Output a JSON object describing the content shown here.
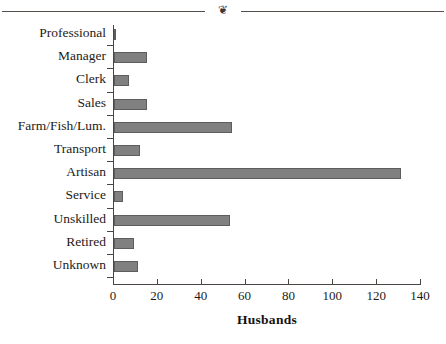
{
  "decoration": {
    "ornament_glyph": "❦",
    "ornament_name": "floral-ornament"
  },
  "chart_data": {
    "type": "bar",
    "orientation": "horizontal",
    "title": "",
    "xlabel": "Husbands",
    "ylabel": "",
    "xlim": [
      0,
      140
    ],
    "xticks": [
      0,
      20,
      40,
      60,
      80,
      100,
      120,
      140
    ],
    "grid": false,
    "legend": null,
    "categories": [
      "Professional",
      "Manager",
      "Clerk",
      "Sales",
      "Farm/Fish/Lum.",
      "Transport",
      "Artisan",
      "Service",
      "Unskilled",
      "Retired",
      "Unknown"
    ],
    "values": [
      1,
      15,
      7,
      15,
      54,
      12,
      131,
      4,
      53,
      9,
      11
    ],
    "series": [
      {
        "name": "Husbands",
        "values": [
          1,
          15,
          7,
          15,
          54,
          12,
          131,
          4,
          53,
          9,
          11
        ]
      }
    ],
    "bar_color": "#808080",
    "bar_edge_color": "#5d5d5d",
    "axis_color": "#4a4542"
  }
}
